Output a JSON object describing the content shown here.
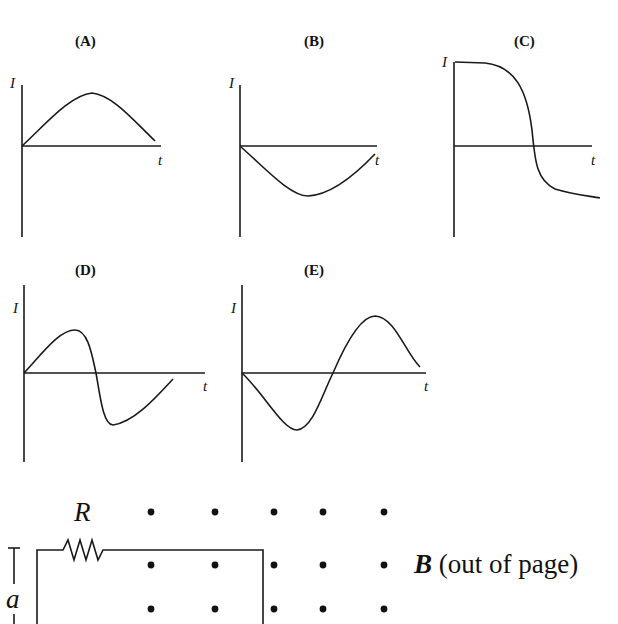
{
  "panels": [
    {
      "id": "A",
      "label": "(A)",
      "y_axis_label": "I",
      "x_axis_label": "t",
      "description": "positive half-cycle hump, rises from zero to peak then falls back toward zero"
    },
    {
      "id": "B",
      "label": "(B)",
      "y_axis_label": "I",
      "x_axis_label": "t",
      "description": "negative half-cycle dip, falls from zero to minimum then rises back toward zero"
    },
    {
      "id": "C",
      "label": "(C)",
      "y_axis_label": "I",
      "x_axis_label": "t",
      "description": "starts at maximum plateau, drops steeply through zero, levels off negative"
    },
    {
      "id": "D",
      "label": "(D)",
      "y_axis_label": "I",
      "x_axis_label": "t",
      "description": "positive hump, sharp drop through zero to negative minimum, rising back"
    },
    {
      "id": "E",
      "label": "(E)",
      "y_axis_label": "I",
      "x_axis_label": "t",
      "description": "negative dip first, then rises through zero to positive peak and falls"
    }
  ],
  "circuit": {
    "resistor_label": "R",
    "dimension_label": "a",
    "field_label_symbol": "B",
    "field_label_text": " (out of page)",
    "field_dot_rows": 3,
    "field_dot_columns": 5
  }
}
